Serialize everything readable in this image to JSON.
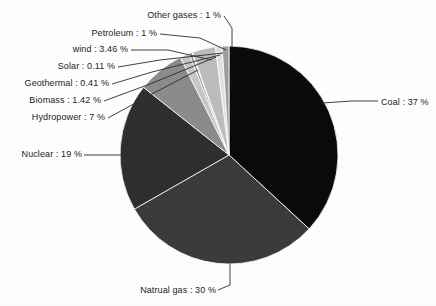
{
  "chart_data": {
    "type": "pie",
    "title": "",
    "subtitle": "",
    "xlabel": "",
    "ylabel": "",
    "legend_position": "callout-labels",
    "grid": false,
    "label_separator": " : ",
    "unit": "%",
    "categories": [
      "Coal",
      "Natrual gas",
      "Nuclear",
      "Hydropower",
      "Biomass",
      "Geothermal",
      "Solar",
      "wind",
      "Petroleum",
      "Other gases"
    ],
    "values": [
      37,
      30,
      19,
      7,
      1.42,
      0.41,
      0.11,
      3.46,
      1,
      1
    ],
    "slices": [
      {
        "name": "Coal",
        "value": 37,
        "label": "Coal : 37 %",
        "color": "#0a0a0a",
        "label_side": "right"
      },
      {
        "name": "Natrual gas",
        "value": 30,
        "label": "Natrual gas : 30 %",
        "color": "#3b3b3b",
        "label_side": "bottom"
      },
      {
        "name": "Nuclear",
        "value": 19,
        "label": "Nuclear : 19 %",
        "color": "#2f2f2f",
        "label_side": "left"
      },
      {
        "name": "Hydropower",
        "value": 7,
        "label": "Hydropower : 7 %",
        "color": "#8c8c8c",
        "label_side": "left"
      },
      {
        "name": "Biomass",
        "value": 1.42,
        "label": "Biomass : 1.42 %",
        "color": "#c8c8c8",
        "label_side": "left"
      },
      {
        "name": "Geothermal",
        "value": 0.41,
        "label": "Geothermal : 0.41 %",
        "color": "#9a9a9a",
        "label_side": "left"
      },
      {
        "name": "Solar",
        "value": 0.11,
        "label": "Solar : 0.11 %",
        "color": "#d8d8d8",
        "label_side": "left"
      },
      {
        "name": "wind",
        "value": 3.46,
        "label": "wind : 3.46 %",
        "color": "#bdbdbd",
        "label_side": "left"
      },
      {
        "name": "Petroleum",
        "value": 1,
        "label": "Petroleum : 1 %",
        "color": "#e2e2e2",
        "label_side": "left"
      },
      {
        "name": "Other gases",
        "value": 1,
        "label": "Other gases : 1 %",
        "color": "#9e9e9e",
        "label_side": "top"
      }
    ],
    "geometry": {
      "center_x": 229,
      "center_y": 155,
      "radius": 109,
      "start_angle_deg": -90,
      "direction": "clockwise"
    }
  },
  "labels": {
    "coal": "Coal : 37 %",
    "natural_gas": "Natrual gas : 30 %",
    "nuclear": "Nuclear : 19 %",
    "hydropower": "Hydropower : 7 %",
    "biomass": "Biomass : 1.42 %",
    "geothermal": "Geothermal : 0.41 %",
    "solar": "Solar : 0.11 %",
    "wind": "wind : 3.46 %",
    "petroleum": "Petroleum : 1 %",
    "other_gases": "Other gases : 1 %"
  },
  "colors": {
    "background": "#ffffff",
    "text": "#1b1b1b",
    "leader_line": "#2b2b2b",
    "slice_edge": "#ffffff"
  }
}
